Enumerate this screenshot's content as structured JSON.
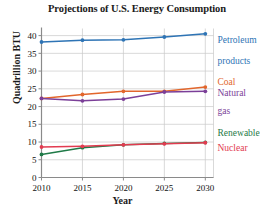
{
  "chart_data": {
    "type": "line",
    "title": "Projections of U.S. Energy Consumption",
    "xlabel": "Year",
    "ylabel": "Quadrillion BTU",
    "x": [
      2010,
      2015,
      2020,
      2025,
      2030
    ],
    "xticklabels": [
      "2010",
      "2015",
      "2020",
      "2025",
      "2030"
    ],
    "yticklabels": [
      "0",
      "5",
      "10",
      "15",
      "20",
      "25",
      "30",
      "35",
      "40"
    ],
    "yticks": [
      0,
      5,
      10,
      15,
      20,
      25,
      30,
      35,
      40
    ],
    "xlim": [
      2010,
      2031
    ],
    "ylim": [
      0,
      42
    ],
    "grid": true,
    "legend_position": "right-inline",
    "markers": true,
    "series": [
      {
        "name": "Petroleum products",
        "label_line1": "Petroleum",
        "label_line2": "products",
        "color": "#2e74b5",
        "values": [
          38.2,
          38.7,
          38.8,
          39.6,
          40.5
        ]
      },
      {
        "name": "Coal",
        "label_line1": "Coal",
        "label_line2": "",
        "color": "#e2662c",
        "values": [
          22.3,
          23.4,
          24.3,
          24.3,
          25.5
        ]
      },
      {
        "name": "Natural gas",
        "label_line1": "Natural",
        "label_line2": "gas",
        "color": "#7b3f98",
        "values": [
          22.3,
          21.6,
          22.1,
          24.1,
          24.3
        ]
      },
      {
        "name": "Renewable",
        "label_line1": "Renewable",
        "label_line2": "",
        "color": "#1f7a47",
        "values": [
          6.5,
          8.4,
          9.2,
          9.6,
          9.9
        ]
      },
      {
        "name": "Nuclear",
        "label_line1": "Nuclear",
        "label_line2": "",
        "color": "#e23b50",
        "values": [
          8.6,
          8.8,
          9.2,
          9.5,
          9.8
        ]
      }
    ]
  },
  "axis": {
    "axis_color": "#8a8a8a",
    "grid_color": "#c9c9c9"
  }
}
